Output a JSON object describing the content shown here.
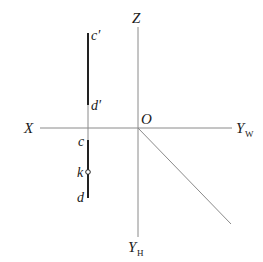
{
  "diagram": {
    "type": "orthographic-projection-axes",
    "axes": {
      "x_label": "X",
      "z_label": "Z",
      "origin_label": "O",
      "yw_label": "Y",
      "yw_sub": "W",
      "yh_label": "Y",
      "yh_sub": "H"
    },
    "points": {
      "c_prime": "c′",
      "d_prime": "d′",
      "c": "c",
      "k": "k",
      "d": "d"
    },
    "colors": {
      "axis": "#8a8a8a",
      "segment": "#222222",
      "text": "#1a1a1a"
    }
  }
}
